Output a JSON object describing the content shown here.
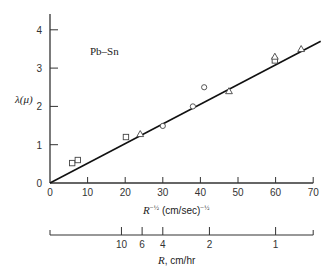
{
  "chart_data": {
    "type": "scatter",
    "title": "",
    "annotation": "Pb–Sn",
    "xlabel": "R^-½ (cm/sec)^-½",
    "xlabel_base": "R",
    "xlabel_exp": "−½",
    "xlabel_units": "(cm/sec)",
    "xlabel_units_exp": "−½",
    "ylabel": "λ(μ)",
    "xlim": [
      0,
      70
    ],
    "ylim": [
      0,
      4.4
    ],
    "x_ticks": [
      0,
      10,
      20,
      30,
      40,
      50,
      60,
      70
    ],
    "y_ticks": [
      0,
      1,
      2,
      3,
      4
    ],
    "grid": false,
    "series": [
      {
        "name": "squares",
        "marker": "square",
        "points": [
          [
            5.9,
            0.52
          ],
          [
            7.4,
            0.6
          ],
          [
            20.2,
            1.2
          ],
          [
            59.8,
            3.2
          ]
        ]
      },
      {
        "name": "circles",
        "marker": "circle",
        "points": [
          [
            30.0,
            1.49
          ],
          [
            38.0,
            2.0
          ],
          [
            41.0,
            2.5
          ]
        ]
      },
      {
        "name": "triangles",
        "marker": "triangle",
        "points": [
          [
            24.0,
            1.28
          ],
          [
            47.6,
            2.4
          ],
          [
            59.8,
            3.3
          ],
          [
            66.8,
            3.5
          ]
        ]
      }
    ],
    "fit_line": {
      "from": [
        0,
        0
      ],
      "to": [
        72,
        3.7
      ]
    },
    "secondary_axis": {
      "label": "R, cm/hr",
      "label_base": "R",
      "label_units": ", cm/hr",
      "ticks": [
        {
          "label": "10",
          "x_equiv": 19
        },
        {
          "label": "6",
          "x_equiv": 24.5
        },
        {
          "label": "4",
          "x_equiv": 30
        },
        {
          "label": "2",
          "x_equiv": 42.4
        },
        {
          "label": "1",
          "x_equiv": 60
        }
      ]
    }
  }
}
